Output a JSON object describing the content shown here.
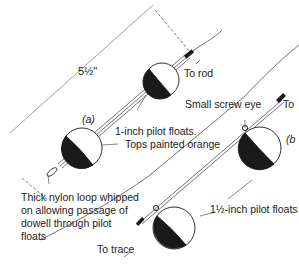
{
  "diagram": {
    "type": "fishing-float-rig-illustration",
    "ink_color": "#1a1a1a",
    "panels": [
      {
        "id": "a",
        "label": "(a)",
        "float_size": "1-inch pilot floats",
        "count": 2
      },
      {
        "id": "b",
        "label": "(b",
        "float_size": "1½-inch pilot floats",
        "count": 2
      }
    ],
    "labels": {
      "dimension": "5½\"",
      "panel_a": "(a)",
      "panel_b": "(b",
      "to_rod": "To rod",
      "small_screw_eye": "Small screw eye",
      "to_top_right": "To",
      "one_inch_floats": "1-inch pilot floats.",
      "tops_painted": "Tops painted orange",
      "nylon_loop_1": "Thick nylon loop whipped",
      "nylon_loop_2": "on allowing passage of",
      "nylon_loop_3": "dowell through pilot",
      "nylon_loop_4": "floats",
      "one_half_inch_floats": "1½-inch pilot floats",
      "to_trace": "To trace"
    }
  }
}
